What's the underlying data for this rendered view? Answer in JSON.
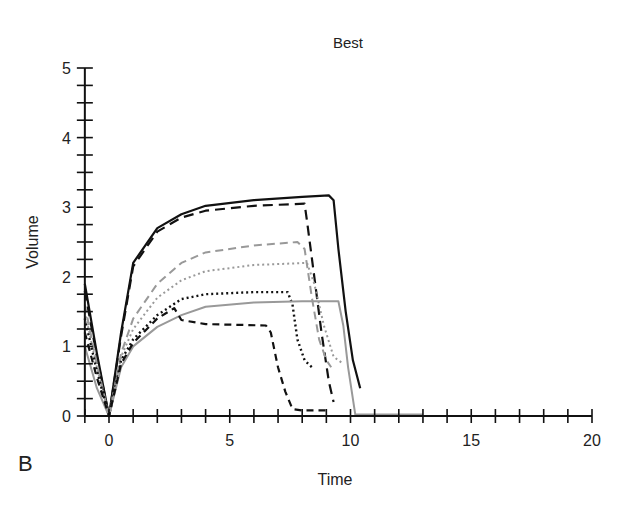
{
  "chart_data": {
    "type": "line",
    "title": "Best",
    "panel_label": "B",
    "xlabel": "Time",
    "ylabel": "Volume",
    "xlim": [
      -1,
      20
    ],
    "ylim": [
      0,
      5
    ],
    "x_ticks": [
      0,
      5,
      10,
      15,
      20
    ],
    "y_ticks": [
      0,
      1,
      2,
      3,
      4,
      5
    ],
    "x_minor_step": 1,
    "y_minor_step": 0.25,
    "grid": false,
    "legend": null,
    "series": [
      {
        "name": "black-solid",
        "color": "#111111",
        "dash": "",
        "width": 2.2,
        "points": [
          [
            -1,
            1.9
          ],
          [
            -0.5,
            0.9
          ],
          [
            0,
            0
          ],
          [
            0.5,
            1.2
          ],
          [
            1,
            2.2
          ],
          [
            2,
            2.7
          ],
          [
            3,
            2.9
          ],
          [
            4,
            3.02
          ],
          [
            6,
            3.1
          ],
          [
            8,
            3.15
          ],
          [
            9.1,
            3.17
          ],
          [
            9.3,
            3.1
          ],
          [
            9.5,
            2.4
          ],
          [
            9.8,
            1.5
          ],
          [
            10.1,
            0.8
          ],
          [
            10.4,
            0.4
          ]
        ]
      },
      {
        "name": "black-long-dash",
        "color": "#111111",
        "dash": "10,6",
        "width": 2.2,
        "points": [
          [
            -1,
            1.8
          ],
          [
            -0.5,
            0.85
          ],
          [
            0,
            0
          ],
          [
            0.5,
            1.15
          ],
          [
            1,
            2.15
          ],
          [
            2,
            2.65
          ],
          [
            3,
            2.85
          ],
          [
            4,
            2.95
          ],
          [
            6,
            3.02
          ],
          [
            8.1,
            3.05
          ],
          [
            8.2,
            2.8
          ],
          [
            8.5,
            2.0
          ],
          [
            8.8,
            1.2
          ],
          [
            9.1,
            0.5
          ],
          [
            9.3,
            0.2
          ]
        ]
      },
      {
        "name": "gray-dashed",
        "color": "#999999",
        "dash": "8,5",
        "width": 2,
        "points": [
          [
            -1,
            1.6
          ],
          [
            -0.5,
            0.75
          ],
          [
            0,
            0
          ],
          [
            0.5,
            0.9
          ],
          [
            1,
            1.4
          ],
          [
            2,
            1.9
          ],
          [
            3,
            2.2
          ],
          [
            4,
            2.35
          ],
          [
            6,
            2.45
          ],
          [
            7.8,
            2.5
          ],
          [
            8.1,
            2.4
          ],
          [
            8.4,
            1.7
          ],
          [
            8.7,
            1.1
          ],
          [
            9,
            0.8
          ],
          [
            9.2,
            0.7
          ]
        ]
      },
      {
        "name": "gray-dotted",
        "color": "#999999",
        "dash": "2,3",
        "width": 2,
        "points": [
          [
            -1,
            1.5
          ],
          [
            -0.5,
            0.7
          ],
          [
            0,
            0
          ],
          [
            0.5,
            0.85
          ],
          [
            1,
            1.25
          ],
          [
            2,
            1.7
          ],
          [
            3,
            1.95
          ],
          [
            4,
            2.08
          ],
          [
            6,
            2.17
          ],
          [
            8.2,
            2.2
          ],
          [
            8.5,
            1.9
          ],
          [
            8.9,
            1.3
          ],
          [
            9.3,
            0.85
          ],
          [
            9.7,
            0.75
          ]
        ]
      },
      {
        "name": "black-dotted",
        "color": "#111111",
        "dash": "2,3",
        "width": 2.4,
        "points": [
          [
            -1,
            1.4
          ],
          [
            -0.5,
            0.65
          ],
          [
            0,
            0
          ],
          [
            0.5,
            0.8
          ],
          [
            1,
            1.1
          ],
          [
            2,
            1.45
          ],
          [
            3,
            1.68
          ],
          [
            4,
            1.75
          ],
          [
            6,
            1.78
          ],
          [
            7.4,
            1.78
          ],
          [
            7.6,
            1.6
          ],
          [
            7.8,
            1.1
          ],
          [
            8.1,
            0.8
          ],
          [
            8.4,
            0.7
          ]
        ]
      },
      {
        "name": "gray-solid",
        "color": "#999999",
        "dash": "",
        "width": 2,
        "points": [
          [
            -1,
            1.0
          ],
          [
            -0.5,
            0.4
          ],
          [
            0,
            0
          ],
          [
            0.5,
            0.7
          ],
          [
            1,
            1.0
          ],
          [
            2,
            1.28
          ],
          [
            3,
            1.45
          ],
          [
            4,
            1.57
          ],
          [
            6,
            1.63
          ],
          [
            8,
            1.65
          ],
          [
            9.5,
            1.65
          ],
          [
            9.7,
            1.3
          ],
          [
            9.9,
            0.7
          ],
          [
            10.2,
            0.02
          ],
          [
            13,
            0.02
          ]
        ]
      },
      {
        "name": "black-short-dash",
        "color": "#111111",
        "dash": "7,5",
        "width": 2.2,
        "points": [
          [
            -1,
            1.2
          ],
          [
            -0.5,
            0.55
          ],
          [
            0,
            0
          ],
          [
            0.5,
            0.75
          ],
          [
            1,
            1.05
          ],
          [
            2,
            1.4
          ],
          [
            2.7,
            1.55
          ],
          [
            3,
            1.38
          ],
          [
            4,
            1.32
          ],
          [
            6.5,
            1.3
          ],
          [
            6.7,
            1.2
          ],
          [
            7.0,
            0.7
          ],
          [
            7.3,
            0.35
          ],
          [
            7.6,
            0.1
          ],
          [
            8,
            0.08
          ],
          [
            9,
            0.08
          ]
        ]
      }
    ]
  }
}
